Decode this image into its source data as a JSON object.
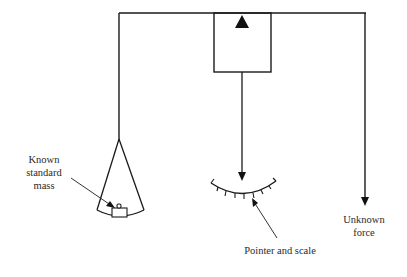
{
  "diagram": {
    "type": "balance-force-measurement",
    "colors": {
      "line": "#1a1a1a",
      "background": "#ffffff"
    },
    "labels": {
      "known_mass_line1": "Known",
      "known_mass_line2": "standard",
      "known_mass_line3": "mass",
      "pointer_scale": "Pointer and scale",
      "unknown_force_line1": "Unknown",
      "unknown_force_line2": "force"
    }
  }
}
